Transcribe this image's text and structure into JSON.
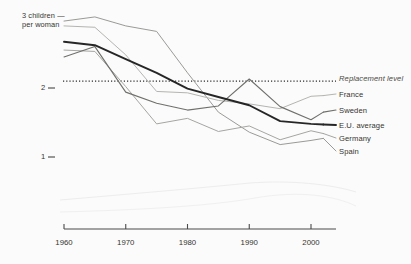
{
  "chart_data": {
    "type": "line",
    "title": "",
    "xlabel": "",
    "ylabel": "3 children per woman",
    "x": [
      1960,
      1965,
      1970,
      1975,
      1980,
      1985,
      1990,
      1995,
      2000,
      2002
    ],
    "xlim": [
      1960,
      2002
    ],
    "ylim": [
      0.55,
      3.1
    ],
    "yticks": [
      1,
      2
    ],
    "ytick_labels": [
      "1",
      "2"
    ],
    "xticks": [
      1960,
      1970,
      1980,
      1990,
      2000
    ],
    "xtick_labels": [
      "1960",
      "1970",
      "1980",
      "1990",
      "2000"
    ],
    "grid": false,
    "legend_position": "right",
    "axis_top_label_line1": "3 children —",
    "axis_top_label_line2": "per woman",
    "annotations": [
      {
        "name": "replacement-level",
        "label": "Replacement level",
        "type": "horizontal-dotted-line",
        "value": 2.1
      }
    ],
    "series": [
      {
        "name": "Spain",
        "color": "#9a9a96",
        "width": 1.0,
        "values": [
          2.97,
          3.03,
          2.9,
          2.82,
          2.22,
          1.65,
          1.36,
          1.18,
          1.24,
          1.27
        ]
      },
      {
        "name": "France",
        "color": "#b4b4b0",
        "width": 1.0,
        "values": [
          2.9,
          2.88,
          2.48,
          1.95,
          1.93,
          1.82,
          1.77,
          1.7,
          1.88,
          1.89
        ]
      },
      {
        "name": "E.U. average",
        "color": "#262626",
        "width": 1.9,
        "values": [
          2.67,
          2.62,
          2.42,
          2.22,
          1.99,
          1.87,
          1.75,
          1.52,
          1.48,
          1.47
        ]
      },
      {
        "name": "Germany",
        "color": "#a5a5a1",
        "width": 1.0,
        "values": [
          2.55,
          2.53,
          2.02,
          1.48,
          1.56,
          1.37,
          1.45,
          1.25,
          1.38,
          1.34
        ]
      },
      {
        "name": "Sweden",
        "color": "#6f6f6b",
        "width": 1.1,
        "values": [
          2.45,
          2.6,
          1.94,
          1.78,
          1.68,
          1.74,
          2.13,
          1.73,
          1.54,
          1.65
        ]
      }
    ]
  },
  "legend": {
    "replacement": "Replacement level",
    "france": "France",
    "sweden": "Sweden",
    "eu_average": "E.U. average",
    "germany": "Germany",
    "spain": "Spain"
  },
  "colors": {
    "background": "#fbfbfb",
    "axis": "#4a4a4a",
    "text": "#35352f",
    "eu_average_line": "#262626",
    "sweden_line": "#6f6f6b",
    "spain_line": "#9a9a96",
    "germany_line": "#a5a5a1",
    "france_line": "#b4b4b0",
    "replacement_line": "#2b2b2b"
  }
}
